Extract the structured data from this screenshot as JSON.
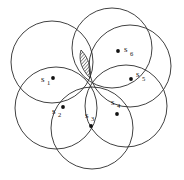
{
  "figure": {
    "background_color": "#ffffff",
    "stroke_color": "#2b2b2b",
    "label_color": "#111111",
    "width": 184,
    "height": 180,
    "common_point": {
      "x": 90,
      "y": 78
    }
  },
  "chart_data": {
    "type": "diagram",
    "title": "",
    "xlabel": "",
    "ylabel": "",
    "circle_radius": 40,
    "circles": [
      {
        "name": "circle-1",
        "cx": 52,
        "cy": 62,
        "r": 41
      },
      {
        "name": "circle-2",
        "cx": 56,
        "cy": 108,
        "r": 41
      },
      {
        "name": "circle-3",
        "cx": 92,
        "cy": 128,
        "r": 41
      },
      {
        "name": "circle-4",
        "cx": 126,
        "cy": 106,
        "r": 41
      },
      {
        "name": "circle-5",
        "cx": 130,
        "cy": 66,
        "r": 41
      },
      {
        "name": "circle-6",
        "cx": 112,
        "cy": 48,
        "r": 40
      }
    ],
    "points": [
      {
        "label": "s",
        "subscript": "1",
        "dot_x": 53,
        "dot_y": 78,
        "label_x": 41,
        "label_y": 82,
        "sub_x": 47,
        "sub_y": 85
      },
      {
        "label": "s",
        "subscript": "2",
        "dot_x": 63,
        "dot_y": 107,
        "label_x": 52,
        "label_y": 114,
        "sub_x": 58,
        "sub_y": 117
      },
      {
        "label": "s",
        "subscript": "3",
        "dot_x": 91,
        "dot_y": 126,
        "label_x": 85,
        "label_y": 118,
        "sub_x": 91,
        "sub_y": 121
      },
      {
        "label": "s",
        "subscript": "4",
        "dot_x": 117,
        "dot_y": 114,
        "label_x": 111,
        "label_y": 105,
        "sub_x": 117,
        "sub_y": 108
      },
      {
        "label": "s",
        "subscript": "5",
        "dot_x": 131,
        "dot_y": 79,
        "label_x": 136,
        "label_y": 77,
        "sub_x": 142,
        "sub_y": 81
      },
      {
        "label": "s",
        "subscript": "6",
        "dot_x": 118,
        "dot_y": 51,
        "label_x": 124,
        "label_y": 52,
        "sub_x": 130,
        "sub_y": 56
      }
    ],
    "hatched_region": {
      "name": "shaded-intersection",
      "fill_pattern": "diagonal-hatch",
      "path": "M 90 78 C 82 70 78 60 81 50 C 88 57 92 68 90 78 Z"
    },
    "axis_ranges": {
      "x": [
        0,
        184
      ],
      "y": [
        0,
        180
      ]
    },
    "grid": false,
    "legend": "none"
  }
}
